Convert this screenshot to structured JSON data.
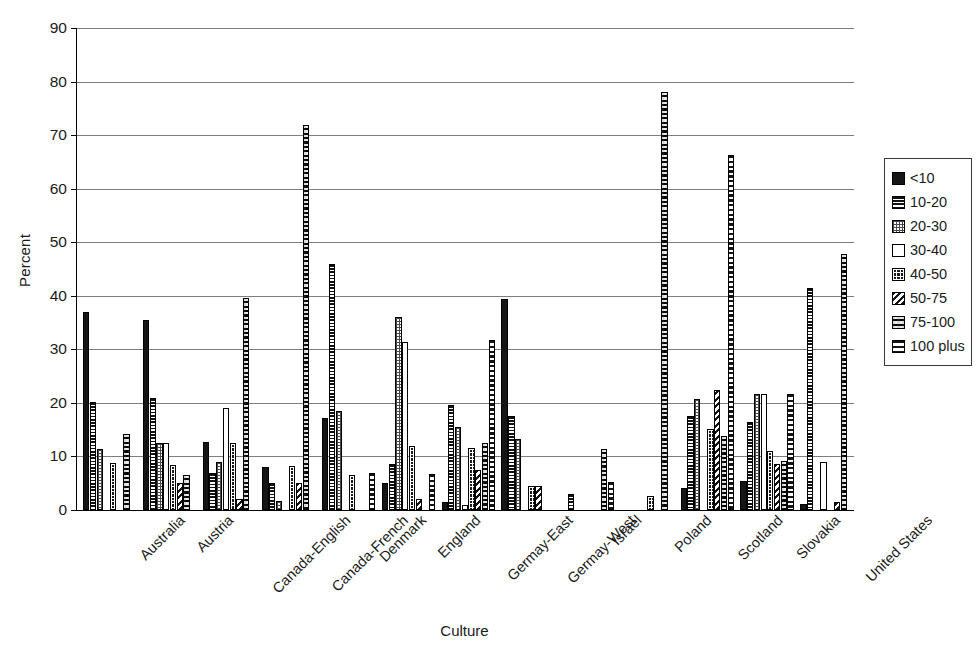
{
  "chart_data": {
    "type": "bar",
    "title": "",
    "xlabel": "Culture",
    "ylabel": "Percent",
    "ylim": [
      0,
      90
    ],
    "ytick_step": 10,
    "yticks": [
      0,
      10,
      20,
      30,
      40,
      50,
      60,
      70,
      80,
      90
    ],
    "grid": true,
    "legend_position": "right",
    "orientation": "vertical",
    "grouping": "clustered",
    "categories": [
      "Australia",
      "Austria",
      "Canada-English",
      "Canada-French",
      "Denmark",
      "England",
      "Germay-East",
      "Germay-West",
      "Israel",
      "Poland",
      "Scotland",
      "Slovakia",
      "United States"
    ],
    "series": [
      {
        "name": "<10",
        "pattern": "solid-black",
        "values": [
          37.0,
          35.5,
          12.7,
          8.0,
          17.2,
          5.0,
          1.5,
          39.4,
          0.0,
          0.0,
          4.1,
          5.5,
          1.2
        ]
      },
      {
        "name": "10-20",
        "pattern": "horizontal-lines",
        "values": [
          20.1,
          20.9,
          7.0,
          5.0,
          46.0,
          8.5,
          19.7,
          17.6,
          3.0,
          0.0,
          17.5,
          16.5,
          41.4
        ]
      },
      {
        "name": "20-30",
        "pattern": "fine-grid",
        "values": [
          11.4,
          12.5,
          9.0,
          1.6,
          18.5,
          36.1,
          15.5,
          13.3,
          0.0,
          0.0,
          20.7,
          21.6,
          0.0
        ]
      },
      {
        "name": "30-40",
        "pattern": "empty-white",
        "values": [
          0.0,
          12.5,
          19.0,
          0.0,
          0.0,
          31.4,
          1.0,
          0.0,
          0.0,
          0.0,
          0.0,
          21.7,
          9.0
        ]
      },
      {
        "name": "40-50",
        "pattern": "black-grid",
        "values": [
          8.7,
          8.4,
          12.5,
          8.3,
          6.5,
          11.9,
          11.5,
          4.4,
          0.0,
          2.7,
          15.1,
          11.0,
          0.0
        ]
      },
      {
        "name": "50-75",
        "pattern": "diagonal-hatch",
        "values": [
          0.0,
          5.0,
          2.0,
          5.0,
          0.0,
          2.0,
          7.5,
          4.4,
          0.0,
          0.0,
          22.4,
          8.5,
          1.5
        ]
      },
      {
        "name": "75-100",
        "pattern": "checker",
        "values": [
          14.2,
          6.5,
          39.5,
          71.8,
          0.0,
          0.0,
          12.5,
          0.0,
          11.4,
          78.1,
          13.8,
          9.2,
          47.8
        ]
      },
      {
        "name": "100 plus",
        "pattern": "wide-horizontal",
        "values": [
          0.0,
          0.0,
          0.0,
          0.0,
          7.0,
          6.8,
          31.8,
          0.0,
          5.3,
          0.0,
          66.2,
          21.6,
          0.0
        ]
      }
    ]
  },
  "legend": {
    "items": [
      {
        "label": "<10"
      },
      {
        "label": "10-20"
      },
      {
        "label": "20-30"
      },
      {
        "label": "30-40"
      },
      {
        "label": "40-50"
      },
      {
        "label": "50-75"
      },
      {
        "label": "75-100"
      },
      {
        "label": "100 plus"
      }
    ]
  }
}
